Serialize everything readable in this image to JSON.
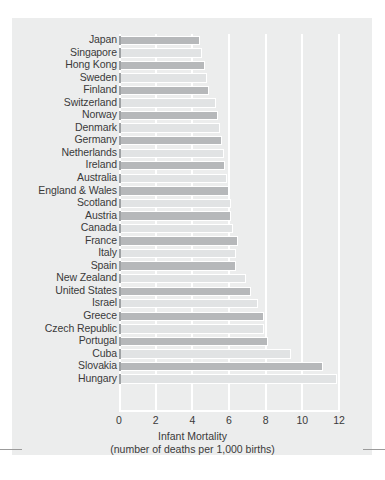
{
  "chart_data": {
    "type": "bar",
    "orientation": "horizontal",
    "title": "",
    "xlabel": "Infant Mortality",
    "xlabel_sub": "(number of deaths per 1,000 births)",
    "ylabel": "",
    "xlim": [
      0,
      12
    ],
    "xticks": [
      "0",
      "2",
      "4",
      "6",
      "8",
      "10",
      "12"
    ],
    "xtick_values": [
      0,
      2,
      4,
      6,
      8,
      10,
      12
    ],
    "grid": "vertical-white",
    "legend": "none",
    "categories": [
      "Japan",
      "Singapore",
      "Hong Kong",
      "Sweden",
      "Finland",
      "Switzerland",
      "Norway",
      "Denmark",
      "Germany",
      "Netherlands",
      "Ireland",
      "Australia",
      "England & Wales",
      "Scotland",
      "Austria",
      "Canada",
      "France",
      "Italy",
      "Spain",
      "New Zealand",
      "United States",
      "Israel",
      "Greece",
      "Czech Republic",
      "Portugal",
      "Cuba",
      "Slovakia",
      "Hungary"
    ],
    "values": [
      4.4,
      4.5,
      4.7,
      4.8,
      4.9,
      5.3,
      5.4,
      5.5,
      5.6,
      5.7,
      5.8,
      5.9,
      6.0,
      6.1,
      6.1,
      6.2,
      6.5,
      6.4,
      6.4,
      6.9,
      7.2,
      7.6,
      7.9,
      7.9,
      8.1,
      9.4,
      11.1,
      11.9
    ],
    "colors": {
      "bar_dark": "#b6b8ba",
      "bar_light": "#e1e3e4",
      "bar_cap": "#9fa2a4",
      "panel_background": "#eceded",
      "gridline": "#ffffff",
      "text": "#3a3a3a",
      "page_background": "#ffffff",
      "crop_mark": "#9b9b9b"
    }
  },
  "figure": {
    "crop_mark_left": "crop-mark",
    "crop_mark_right": "crop-mark"
  }
}
